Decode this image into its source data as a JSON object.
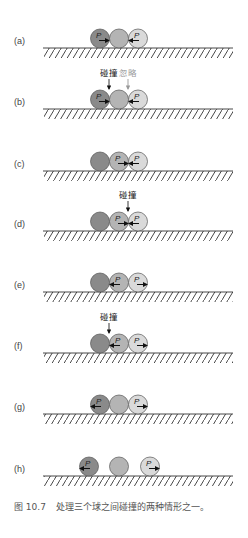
{
  "figure": {
    "caption_number": "图 10.7",
    "caption_text": "处理三个球之间碰撞的两种情形之一。",
    "colors": {
      "ball_dark": "#8a8a8a",
      "ball_mid": "#b4b4b4",
      "ball_light": "#dadada",
      "ink": "#222222",
      "ignore_ink": "#999999"
    },
    "panels": [
      {
        "label": "(a)",
        "ground_y": 48,
        "balls": [
          {
            "x": 100,
            "shade": "dark",
            "p": true,
            "arrow": "right"
          },
          {
            "x": 119,
            "shade": "mid",
            "p": false,
            "arrow": null
          },
          {
            "x": 138,
            "shade": "light",
            "p": true,
            "arrow": "left"
          }
        ],
        "annotations": []
      },
      {
        "label": "(b)",
        "ground_y": 109,
        "balls": [
          {
            "x": 100,
            "shade": "dark",
            "p": true,
            "arrow": "right"
          },
          {
            "x": 119,
            "shade": "mid",
            "p": false,
            "arrow": null
          },
          {
            "x": 138,
            "shade": "light",
            "p": true,
            "arrow": "left"
          }
        ],
        "annotations": [
          {
            "text": "碰撞",
            "x": 109,
            "style": "collide"
          },
          {
            "text": "忽略",
            "x": 128,
            "style": "ignore"
          }
        ]
      },
      {
        "label": "(c)",
        "ground_y": 171,
        "balls": [
          {
            "x": 100,
            "shade": "dark",
            "p": false,
            "arrow": null
          },
          {
            "x": 119,
            "shade": "mid",
            "p": true,
            "arrow": "right"
          },
          {
            "x": 138,
            "shade": "light",
            "p": true,
            "arrow": "left"
          }
        ],
        "annotations": []
      },
      {
        "label": "(d)",
        "ground_y": 231,
        "balls": [
          {
            "x": 100,
            "shade": "dark",
            "p": false,
            "arrow": null
          },
          {
            "x": 119,
            "shade": "mid",
            "p": true,
            "arrow": "right"
          },
          {
            "x": 138,
            "shade": "light",
            "p": true,
            "arrow": "left"
          }
        ],
        "annotations": [
          {
            "text": "碰撞",
            "x": 128,
            "style": "collide"
          }
        ]
      },
      {
        "label": "(e)",
        "ground_y": 292,
        "balls": [
          {
            "x": 100,
            "shade": "dark",
            "p": false,
            "arrow": null
          },
          {
            "x": 119,
            "shade": "mid",
            "p": true,
            "arrow": "left"
          },
          {
            "x": 138,
            "shade": "light",
            "p": true,
            "arrow": "right"
          }
        ],
        "annotations": []
      },
      {
        "label": "(f)",
        "ground_y": 353,
        "balls": [
          {
            "x": 100,
            "shade": "dark",
            "p": false,
            "arrow": null
          },
          {
            "x": 119,
            "shade": "mid",
            "p": true,
            "arrow": "left"
          },
          {
            "x": 138,
            "shade": "light",
            "p": true,
            "arrow": "right"
          }
        ],
        "annotations": [
          {
            "text": "碰撞",
            "x": 109,
            "style": "collide"
          }
        ]
      },
      {
        "label": "(g)",
        "ground_y": 414,
        "balls": [
          {
            "x": 100,
            "shade": "dark",
            "p": true,
            "arrow": "left"
          },
          {
            "x": 119,
            "shade": "mid",
            "p": false,
            "arrow": null
          },
          {
            "x": 138,
            "shade": "light",
            "p": true,
            "arrow": "right"
          }
        ],
        "annotations": []
      },
      {
        "label": "(h)",
        "ground_y": 476,
        "balls": [
          {
            "x": 89,
            "shade": "dark",
            "p": true,
            "arrow": "left"
          },
          {
            "x": 119,
            "shade": "mid",
            "p": false,
            "arrow": null
          },
          {
            "x": 150,
            "shade": "light",
            "p": true,
            "arrow": "right"
          }
        ],
        "annotations": []
      }
    ],
    "ball_label": "P"
  }
}
